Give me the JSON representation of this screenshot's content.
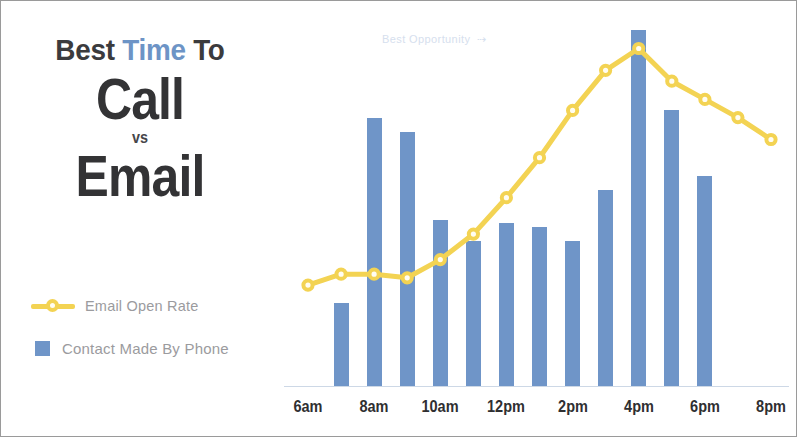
{
  "title": {
    "line1_a": "Best ",
    "line1_b": "Time",
    "line1_c": " To",
    "word_call": "Call",
    "word_vs": "vs",
    "word_email": "Email"
  },
  "legend": {
    "items": [
      {
        "label": "Email Open Rate",
        "marker": "line-circle-marker",
        "color": "#f3d353"
      },
      {
        "label": "Contact Made By Phone",
        "marker": "square-swatch",
        "color": "#6f95c8"
      }
    ]
  },
  "annotation": {
    "text": "Best Opportunity",
    "arrow": "⇢",
    "color": "#d6e0ee"
  },
  "colors": {
    "bar_blue": "#6f95c8",
    "line_yellow": "#f3d353",
    "title_dark": "#333335",
    "title_blue": "#6d94c6",
    "legend_text": "#9b9b9e",
    "axis": "#cdd8e6"
  },
  "chart_data": {
    "type": "bar",
    "title": "Best Time To Call vs Email",
    "xlabel": "",
    "ylabel": "",
    "grid": false,
    "legend_position": "left",
    "axis_tick_labels": [
      "6am",
      "8am",
      "10am",
      "12pm",
      "2pm",
      "4pm",
      "6pm",
      "8pm"
    ],
    "x_hours": [
      "6am",
      "7am",
      "8am",
      "9am",
      "10am",
      "11am",
      "12pm",
      "1pm",
      "2pm",
      "3pm",
      "4pm",
      "5pm",
      "6pm",
      "7pm",
      "8pm"
    ],
    "ylim": [
      0,
      100
    ],
    "series": [
      {
        "name": "Contact Made By Phone",
        "type": "bar",
        "color": "#6f95c8",
        "categories": [
          "7am",
          "8am",
          "9am",
          "10am",
          "11am",
          "12pm",
          "1pm",
          "2pm",
          "3pm",
          "4pm",
          "5pm",
          "6pm"
        ],
        "values": [
          23,
          74,
          70,
          46,
          40,
          45,
          44,
          40,
          54,
          98,
          76,
          58
        ]
      },
      {
        "name": "Email Open Rate",
        "type": "line",
        "color": "#f3d353",
        "categories": [
          "6am",
          "7am",
          "8am",
          "9am",
          "10am",
          "11am",
          "12pm",
          "1pm",
          "2pm",
          "3pm",
          "4pm",
          "5pm",
          "6pm",
          "7pm",
          "8pm"
        ],
        "values": [
          28,
          31,
          31,
          30,
          35,
          42,
          52,
          63,
          76,
          87,
          93,
          84,
          79,
          74,
          68
        ]
      }
    ]
  }
}
